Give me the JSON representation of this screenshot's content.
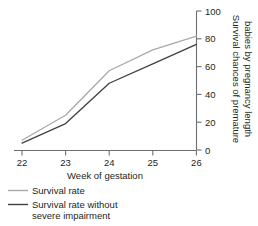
{
  "chart_data": {
    "type": "line",
    "title": "",
    "xlabel": "Week of gestation",
    "ylabel": "Survival chances of premature babies by pregnancy length",
    "x": [
      22,
      23,
      24,
      25,
      26
    ],
    "xlim": [
      22,
      26
    ],
    "ylim": [
      0,
      100
    ],
    "xticks": [
      "22",
      "23",
      "24",
      "25",
      "26"
    ],
    "yticks": [
      "0",
      "20",
      "40",
      "60",
      "80",
      "100"
    ],
    "ytick_values": [
      0,
      20,
      40,
      60,
      80,
      100
    ],
    "grid": false,
    "y_axis_position": "right",
    "legend_position": "below-left",
    "series": [
      {
        "name": "Survival rate",
        "color": "#a7a9ac",
        "values": [
          7,
          25,
          57,
          72,
          82
        ]
      },
      {
        "name": "Survival rate without severe impairment",
        "color": "#414042",
        "values": [
          5,
          19,
          48,
          62,
          76
        ]
      }
    ]
  },
  "axes": {
    "x_label": "Week of gestation",
    "y_label": "Survival chances of premature babies by pregnancy length"
  },
  "legend": {
    "items": [
      {
        "label": "Survival rate",
        "color": "#a7a9ac"
      },
      {
        "label": "Survival rate without",
        "label2": "severe impairment",
        "color": "#414042"
      }
    ]
  },
  "colors": {
    "axis": "#6d6e71",
    "text": "#231f20",
    "series_light": "#a7a9ac",
    "series_dark": "#414042",
    "background": "#ffffff"
  }
}
